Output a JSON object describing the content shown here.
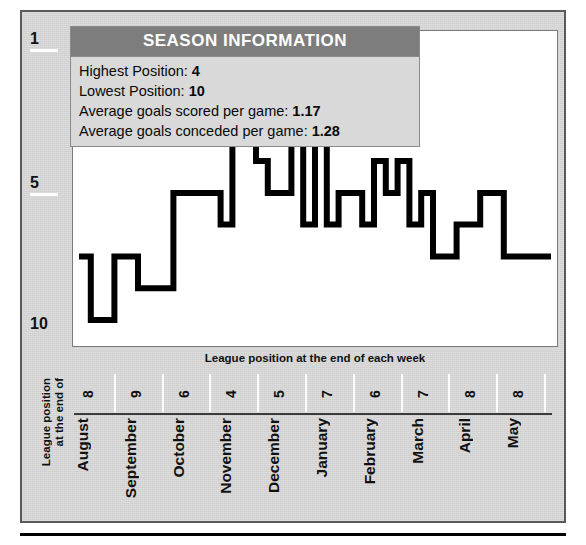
{
  "info_panel": {
    "title": "SEASON INFORMATION",
    "rows": [
      {
        "label": "Highest Position:",
        "value": "4"
      },
      {
        "label": "Lowest Position:",
        "value": "10"
      },
      {
        "label": "Average goals scored per game:",
        "value": "1.17"
      },
      {
        "label": "Average goals conceded per game:",
        "value": "1.28"
      }
    ]
  },
  "plot_caption": "League position at the end of each week",
  "y_axis_caption_line1": "League position",
  "y_axis_caption_line2": "at the end of",
  "y_axis": {
    "ticks": [
      "1",
      "5",
      "10"
    ]
  },
  "colors": {
    "card_background": "#d4d4d4",
    "card_border": "#5a5a5a",
    "plot_background": "#ffffff",
    "line": "#000000",
    "info_title_bar": "#7d7d7d",
    "info_body": "#d9d9d9",
    "tick_white": "#ffffff",
    "axis_rule": "#3b3b3b"
  },
  "chart_data": {
    "type": "line",
    "title": "SEASON INFORMATION",
    "xlabel": "League position at the end of each week",
    "ylabel": "League position at the end of",
    "ylim": [
      1,
      10.6
    ],
    "y_inverted": true,
    "y_ticks": [
      1,
      5,
      10
    ],
    "grid": false,
    "legend": null,
    "months": [
      {
        "name": "August",
        "end_position": 8
      },
      {
        "name": "September",
        "end_position": 9
      },
      {
        "name": "October",
        "end_position": 6
      },
      {
        "name": "November",
        "end_position": 4
      },
      {
        "name": "December",
        "end_position": 5
      },
      {
        "name": "January",
        "end_position": 7
      },
      {
        "name": "February",
        "end_position": 6
      },
      {
        "name": "March",
        "end_position": 7
      },
      {
        "name": "April",
        "end_position": 8
      },
      {
        "name": "May",
        "end_position": 8
      }
    ],
    "x": "week index (1 = first week of August … 41 = final week of May)",
    "series": [
      {
        "name": "League position",
        "values": [
          8,
          10,
          10,
          8,
          8,
          9,
          9,
          9,
          6,
          6,
          6,
          6,
          7,
          4,
          4,
          5,
          6,
          6,
          4,
          7,
          4,
          7,
          6,
          6,
          7,
          5,
          6,
          5,
          7,
          6,
          8,
          8,
          7,
          7,
          6,
          6,
          8,
          8,
          8,
          8
        ]
      }
    ],
    "annotations": {
      "highest_position": 4,
      "lowest_position": 10,
      "avg_goals_scored_per_game": 1.17,
      "avg_goals_conceded_per_game": 1.28
    }
  }
}
